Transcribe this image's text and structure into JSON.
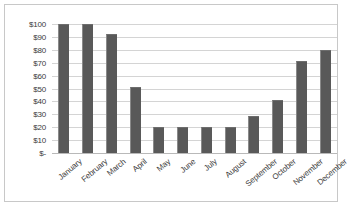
{
  "chart_data": {
    "type": "bar",
    "title": "",
    "subtitle": "",
    "xlabel": "",
    "ylabel": "",
    "categories": [
      "January",
      "February",
      "March",
      "April",
      "May",
      "June",
      "July",
      "August",
      "September",
      "October",
      "November",
      "December"
    ],
    "values": [
      100,
      100,
      92,
      51,
      20,
      20,
      20,
      20,
      29,
      41,
      71,
      80
    ],
    "series": [
      {
        "name": "",
        "values": [
          100,
          100,
          92,
          51,
          20,
          20,
          20,
          20,
          29,
          41,
          71,
          80
        ]
      }
    ],
    "ylim": [
      0,
      100
    ],
    "y_ticks": [
      0,
      10,
      20,
      30,
      40,
      50,
      60,
      70,
      80,
      90,
      100
    ],
    "y_tick_labels": [
      "$-",
      "$10",
      "$20",
      "$30",
      "$40",
      "$50",
      "$60",
      "$70",
      "$80",
      "$90",
      "$100"
    ],
    "grid": true,
    "legend": false,
    "legend_position": "none",
    "annotations": [],
    "colors": {
      "bar_fill": "#595959",
      "bar_edge_light": "#8a8a8a",
      "gridline": "#d4d4d4",
      "axis_line": "#b9b9b9",
      "frame": "#c8c8c8",
      "background": "#ffffff",
      "text": "#3b3b3b"
    }
  }
}
